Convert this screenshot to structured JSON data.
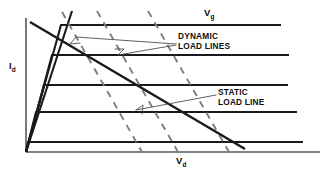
{
  "figure": {
    "background_color": "#ffffff",
    "width": 333,
    "height": 179
  },
  "axes": {
    "y_axis": {
      "label_text": "I",
      "label_subscript": "d",
      "name": "drain-current",
      "color": "#555a5e",
      "x": 26,
      "y_top": 18,
      "y_bottom": 152
    },
    "x_axis": {
      "label_text": "V",
      "label_subscript": "d",
      "name": "drain-voltage",
      "color": "#555a5e",
      "y": 152,
      "x_left": 26,
      "x_right": 320
    }
  },
  "annotations": {
    "family_parameter": {
      "text": "V",
      "subscript": "g",
      "name": "gate-voltage-family-label"
    },
    "dynamic": {
      "line1": "DYNAMIC",
      "line2": "LOAD LINES",
      "color": "#7a7f84"
    },
    "static": {
      "line1": "STATIC",
      "line2": "LOAD LINE",
      "color": "#1a1a1a"
    }
  },
  "chart_data": {
    "type": "line",
    "title": "",
    "xlabel": "Vd",
    "ylabel": "Id",
    "grid": false,
    "legend": "inline-annotations",
    "xlim": [
      0,
      320
    ],
    "ylim": [
      0,
      152
    ],
    "characteristic_curves": {
      "count": 5,
      "description": "Family of drain characteristic curves for increasing Vg; each rises steeply from the origin then saturates to a near-horizontal plateau.",
      "curves": [
        {
          "name": "curve-vg-5",
          "knee_x": 61,
          "plateau_y": 25,
          "end_x": 281
        },
        {
          "name": "curve-vg-4",
          "knee_x": 52,
          "plateau_y": 55,
          "end_x": 289
        },
        {
          "name": "curve-vg-3",
          "knee_x": 44,
          "plateau_y": 85,
          "end_x": 288
        },
        {
          "name": "curve-vg-2",
          "knee_x": 36,
          "plateau_y": 112,
          "end_x": 297
        },
        {
          "name": "curve-vg-1",
          "knee_x": 28,
          "plateau_y": 142,
          "end_x": 303
        }
      ]
    },
    "static_load_line": {
      "name": "static-load-line",
      "start": [
        30,
        22
      ],
      "end": [
        245,
        149
      ],
      "style": "solid",
      "slope_sign": "negative"
    },
    "dynamic_load_lines": {
      "name": "dynamic-load-lines",
      "count": 3,
      "style": "dashed",
      "slope_sign": "negative-steep",
      "lines": [
        {
          "start": [
            62,
            12
          ],
          "end": [
            142,
            152
          ]
        },
        {
          "start": [
            97,
            11
          ],
          "end": [
            178,
            152
          ]
        },
        {
          "start": [
            148,
            11
          ],
          "end": [
            229,
            152
          ]
        }
      ]
    },
    "knee_locus": {
      "name": "knee-locus-line",
      "description": "Steep line through the knees of all characteristic curves",
      "start": [
        72,
        11
      ],
      "end": [
        26,
        152
      ]
    }
  }
}
